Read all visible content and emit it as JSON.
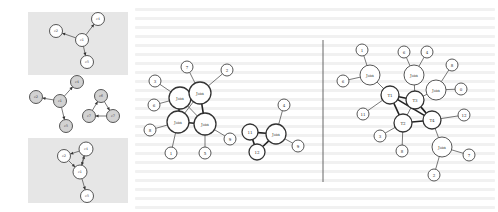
{
  "figure": {
    "left_panels": [
      {
        "id": "panel-1",
        "background": "#e6e6e6",
        "box": [
          28,
          12,
          100,
          63
        ],
        "node_style": "white",
        "nodes": [
          {
            "id": "c1",
            "label": "c1",
            "x": 82,
            "y": 40,
            "r": 6.5
          },
          {
            "id": "c2",
            "label": "c2",
            "x": 56,
            "y": 31,
            "r": 6.5
          },
          {
            "id": "c4",
            "label": "c4",
            "x": 98,
            "y": 19,
            "r": 6.5
          },
          {
            "id": "c5",
            "label": "c5",
            "x": 87,
            "y": 62,
            "r": 6.5
          }
        ],
        "edges": [
          [
            "c1",
            "c2"
          ],
          [
            "c1",
            "c4"
          ],
          [
            "c1",
            "c5"
          ]
        ],
        "directed": true
      },
      {
        "id": "panel-2",
        "background": "none",
        "box": [
          28,
          77,
          100,
          58
        ],
        "node_style": "gray",
        "nodes": [
          {
            "id": "c1",
            "label": "c1",
            "x": 60,
            "y": 101,
            "r": 6.5
          },
          {
            "id": "c2",
            "label": "c2",
            "x": 36,
            "y": 97,
            "r": 6.5
          },
          {
            "id": "c4",
            "label": "c4",
            "x": 77,
            "y": 82,
            "r": 6.5
          },
          {
            "id": "c5",
            "label": "c5",
            "x": 66,
            "y": 126,
            "r": 6.5
          },
          {
            "id": "c6",
            "label": "c6",
            "x": 101,
            "y": 96,
            "r": 6.5
          },
          {
            "id": "c7",
            "label": "c7",
            "x": 89,
            "y": 116,
            "r": 6.5
          },
          {
            "id": "c8",
            "label": "c7",
            "x": 113,
            "y": 116,
            "r": 6.5
          }
        ],
        "edges": [
          [
            "c1",
            "c2"
          ],
          [
            "c1",
            "c4"
          ],
          [
            "c1",
            "c5"
          ],
          [
            "c6",
            "c8"
          ],
          [
            "c8",
            "c7"
          ],
          [
            "c7",
            "c6"
          ]
        ],
        "directed": true
      },
      {
        "id": "panel-3",
        "background": "#e6e6e6",
        "box": [
          28,
          138,
          100,
          65
        ],
        "node_style": "white",
        "nodes": [
          {
            "id": "c1",
            "label": "c1",
            "x": 80,
            "y": 172,
            "r": 7
          },
          {
            "id": "c2",
            "label": "c2",
            "x": 64,
            "y": 156,
            "r": 6.5
          },
          {
            "id": "c4",
            "label": "c4",
            "x": 86,
            "y": 149,
            "r": 7
          },
          {
            "id": "c5",
            "label": "c5",
            "x": 87,
            "y": 196,
            "r": 6.5
          }
        ],
        "edges": [
          [
            "c4",
            "c2"
          ],
          [
            "c2",
            "c1"
          ],
          [
            "c1",
            "c4"
          ],
          [
            "c4",
            "c1"
          ],
          [
            "c1",
            "c5"
          ]
        ],
        "directed": true
      }
    ],
    "middle_graph": {
      "nodes": [
        {
          "id": "j1",
          "label": "Join",
          "x": 180,
          "y": 98,
          "r": 11,
          "hub": true
        },
        {
          "id": "j2",
          "label": "Join",
          "x": 200,
          "y": 93,
          "r": 11,
          "hub": true
        },
        {
          "id": "j3",
          "label": "Join",
          "x": 178,
          "y": 122,
          "r": 11,
          "hub": true
        },
        {
          "id": "j4",
          "label": "Join",
          "x": 205,
          "y": 124,
          "r": 11,
          "hub": true
        },
        {
          "id": "n7",
          "label": "7",
          "x": 187,
          "y": 67,
          "r": 6,
          "hub": false
        },
        {
          "id": "n2",
          "label": "2",
          "x": 227,
          "y": 70,
          "r": 6,
          "hub": false
        },
        {
          "id": "n3",
          "label": "3",
          "x": 155,
          "y": 81,
          "r": 6,
          "hub": false
        },
        {
          "id": "n6",
          "label": "6",
          "x": 154,
          "y": 105,
          "r": 6,
          "hub": false
        },
        {
          "id": "n8",
          "label": "8",
          "x": 150,
          "y": 130,
          "r": 6,
          "hub": false
        },
        {
          "id": "n1",
          "label": "1",
          "x": 171,
          "y": 153,
          "r": 6,
          "hub": false
        },
        {
          "id": "n5",
          "label": "5",
          "x": 205,
          "y": 153,
          "r": 6,
          "hub": false
        },
        {
          "id": "n9",
          "label": "9",
          "x": 230,
          "y": 139,
          "r": 6,
          "hub": false
        },
        {
          "id": "t1",
          "label": "11",
          "x": 250,
          "y": 132,
          "r": 8,
          "hub": true
        },
        {
          "id": "t2",
          "label": "12",
          "x": 257,
          "y": 152,
          "r": 8,
          "hub": true
        },
        {
          "id": "jr",
          "label": "Join",
          "x": 276,
          "y": 134,
          "r": 10,
          "hub": true
        },
        {
          "id": "n4",
          "label": "4",
          "x": 284,
          "y": 105,
          "r": 6,
          "hub": false
        },
        {
          "id": "n9b",
          "label": "9",
          "x": 298,
          "y": 146,
          "r": 6,
          "hub": false
        }
      ],
      "thin_edges": [
        [
          "j2",
          "n7"
        ],
        [
          "j2",
          "n2"
        ],
        [
          "j1",
          "n3"
        ],
        [
          "j1",
          "n6"
        ],
        [
          "j3",
          "n8"
        ],
        [
          "j3",
          "n1"
        ],
        [
          "j4",
          "n5"
        ],
        [
          "j4",
          "n9"
        ],
        [
          "jr",
          "n4"
        ],
        [
          "jr",
          "n9b"
        ],
        [
          "j1",
          "j4"
        ],
        [
          "j2",
          "j3"
        ]
      ],
      "thick_edges": [
        [
          "j1",
          "j2"
        ],
        [
          "j1",
          "j3"
        ],
        [
          "j2",
          "j4"
        ],
        [
          "j3",
          "j4"
        ],
        [
          "t1",
          "jr"
        ],
        [
          "t1",
          "t2"
        ],
        [
          "t2",
          "jr"
        ]
      ]
    },
    "right_graph": {
      "nodes": [
        {
          "id": "T1",
          "label": "T1",
          "x": 390,
          "y": 95,
          "r": 9,
          "hub": true
        },
        {
          "id": "T3",
          "label": "T3",
          "x": 415,
          "y": 100,
          "r": 9,
          "hub": true
        },
        {
          "id": "T2",
          "label": "T2",
          "x": 403,
          "y": 123,
          "r": 9,
          "hub": true
        },
        {
          "id": "T4",
          "label": "T4",
          "x": 432,
          "y": 120,
          "r": 9,
          "hub": true
        },
        {
          "id": "ja",
          "label": "Join",
          "x": 370,
          "y": 75,
          "r": 10,
          "hub": false
        },
        {
          "id": "jb",
          "label": "Join",
          "x": 414,
          "y": 75,
          "r": 10,
          "hub": false
        },
        {
          "id": "jc",
          "label": "Join",
          "x": 436,
          "y": 90,
          "r": 10,
          "hub": false
        },
        {
          "id": "jd",
          "label": "Join",
          "x": 442,
          "y": 147,
          "r": 10,
          "hub": false
        },
        {
          "id": "n1",
          "label": "1",
          "x": 362,
          "y": 50,
          "r": 6,
          "hub": false
        },
        {
          "id": "n6",
          "label": "6",
          "x": 343,
          "y": 81,
          "r": 6,
          "hub": false
        },
        {
          "id": "n6b",
          "label": "6",
          "x": 404,
          "y": 52,
          "r": 6,
          "hub": false
        },
        {
          "id": "n4",
          "label": "4",
          "x": 427,
          "y": 52,
          "r": 6,
          "hub": false
        },
        {
          "id": "n8",
          "label": "8",
          "x": 452,
          "y": 65,
          "r": 6,
          "hub": false
        },
        {
          "id": "n0",
          "label": "0",
          "x": 461,
          "y": 89,
          "r": 6,
          "hub": false
        },
        {
          "id": "n11",
          "label": "11",
          "x": 363,
          "y": 114,
          "r": 6,
          "hub": false
        },
        {
          "id": "n12",
          "label": "12",
          "x": 464,
          "y": 115,
          "r": 6,
          "hub": false
        },
        {
          "id": "n3",
          "label": "3",
          "x": 380,
          "y": 136,
          "r": 6,
          "hub": false
        },
        {
          "id": "n8b",
          "label": "8",
          "x": 402,
          "y": 151,
          "r": 6,
          "hub": false
        },
        {
          "id": "n7",
          "label": "7",
          "x": 469,
          "y": 155,
          "r": 6,
          "hub": false
        },
        {
          "id": "n2",
          "label": "2",
          "x": 434,
          "y": 175,
          "r": 6,
          "hub": false
        }
      ],
      "thin_edges": [
        [
          "ja",
          "n1"
        ],
        [
          "ja",
          "n6"
        ],
        [
          "ja",
          "T1"
        ],
        [
          "jb",
          "n6b"
        ],
        [
          "jb",
          "n4"
        ],
        [
          "jb",
          "T3"
        ],
        [
          "jc",
          "n8"
        ],
        [
          "jc",
          "n0"
        ],
        [
          "jc",
          "T3"
        ],
        [
          "T1",
          "n11"
        ],
        [
          "T4",
          "n12"
        ],
        [
          "T2",
          "n3"
        ],
        [
          "T2",
          "n8b"
        ],
        [
          "T4",
          "jd"
        ],
        [
          "jd",
          "n7"
        ],
        [
          "jd",
          "n2"
        ],
        [
          "T2",
          "T3"
        ]
      ],
      "thick_edges": [
        [
          "T1",
          "T3"
        ],
        [
          "T1",
          "T2"
        ],
        [
          "T1",
          "T4"
        ],
        [
          "T3",
          "T4"
        ],
        [
          "T2",
          "T4"
        ]
      ]
    },
    "divider": {
      "x": 323,
      "y1": 40,
      "y2": 182
    }
  }
}
